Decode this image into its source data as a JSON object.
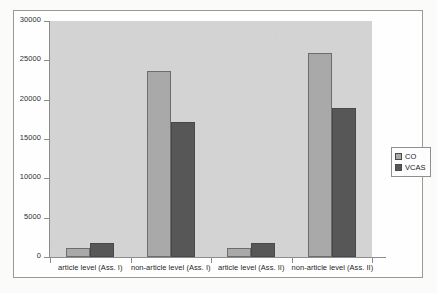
{
  "chart_data": {
    "type": "bar",
    "title": "",
    "subtitle": "",
    "xlabel": "",
    "ylabel": "",
    "grid": false,
    "legend_position": "right",
    "ylim": [
      0,
      30000
    ],
    "ytick_labels": [
      "0",
      "5000",
      "10000",
      "15000",
      "20000",
      "25000",
      "30000"
    ],
    "ytick_values": [
      0,
      5000,
      10000,
      15000,
      20000,
      25000,
      30000
    ],
    "categories": [
      "article level (Ass. I)",
      "non-article level (Ass. I)",
      "article level (Ass. II)",
      "non-article level (Ass. II)"
    ],
    "series": [
      {
        "name": "CO",
        "color": "#a9a9a9",
        "values": [
          1200,
          23600,
          1100,
          25900
        ]
      },
      {
        "name": "VCAS",
        "color": "#575757",
        "values": [
          1800,
          17200,
          1800,
          18900
        ]
      }
    ]
  },
  "legend": {
    "entries": [
      {
        "label": "CO",
        "swatch": "legend-swatch-co"
      },
      {
        "label": "VCAS",
        "swatch": "legend-swatch-vcas"
      }
    ]
  },
  "colors": {
    "series_co": "#a9a9a9",
    "series_vcas": "#575757",
    "plot_background": "#d3d3d3",
    "axis": "#8c8c8c",
    "frame": "#9a9a9a",
    "page_background": "#fbfbfa"
  }
}
